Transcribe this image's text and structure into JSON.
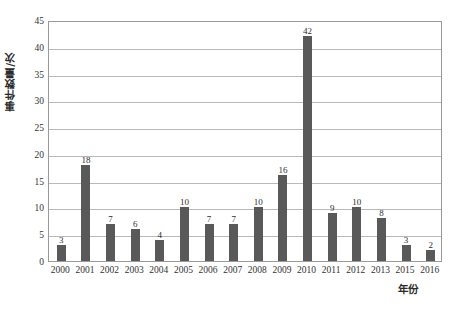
{
  "chart_data": {
    "type": "bar",
    "title": "",
    "subtitle": "",
    "xlabel": "年份",
    "ylabel": "事件数量/次",
    "categories": [
      "2000",
      "2001",
      "2002",
      "2003",
      "2004",
      "2005",
      "2006",
      "2007",
      "2008",
      "2009",
      "2010",
      "2011",
      "2012",
      "2013",
      "2015",
      "2016"
    ],
    "values": [
      3,
      18,
      7,
      6,
      4,
      10,
      7,
      7,
      10,
      16,
      42,
      9,
      10,
      8,
      3,
      2
    ],
    "series": [
      {
        "name": "事件数量/次",
        "values": [
          3,
          18,
          7,
          6,
          4,
          10,
          7,
          7,
          10,
          16,
          42,
          9,
          10,
          8,
          3,
          2
        ]
      }
    ],
    "data_labels": [
      "3",
      "18",
      "7",
      "6",
      "4",
      "10",
      "7",
      "7",
      "10",
      "16",
      "42",
      "9",
      "10",
      "8",
      "3",
      "2"
    ],
    "ylim": [
      0,
      45
    ],
    "yticks": [
      0,
      5,
      10,
      15,
      20,
      25,
      30,
      35,
      40,
      45
    ],
    "ytick_labels": [
      "0",
      "5",
      "10",
      "15",
      "20",
      "25",
      "30",
      "35",
      "40",
      "45"
    ],
    "grid": "horizontal",
    "legend": "none",
    "bar_color": "#595959",
    "gridline_color": "#b9b9b9",
    "axis_color": "#9a9a9a",
    "background_color": "#ffffff"
  }
}
